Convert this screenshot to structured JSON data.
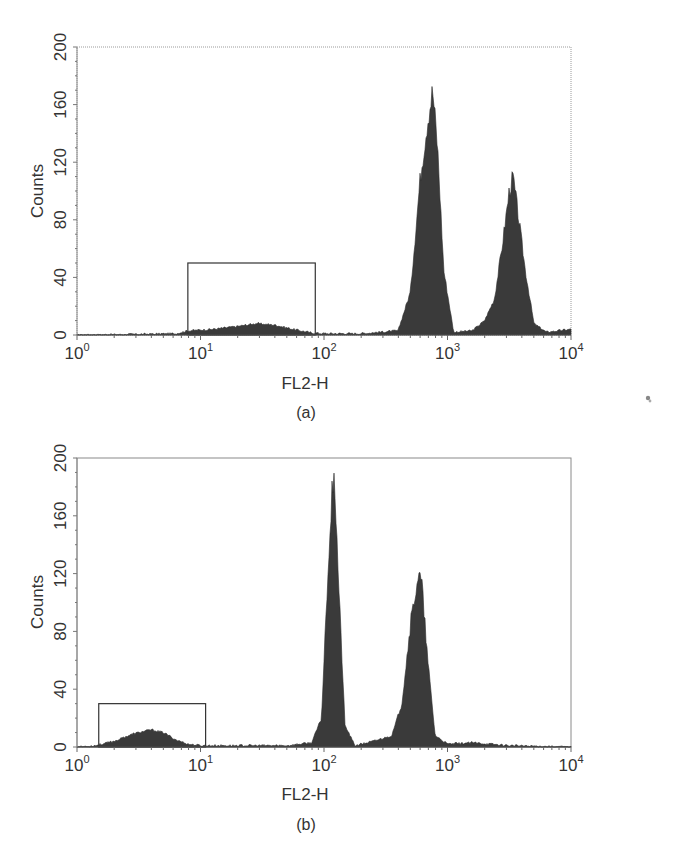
{
  "chart_data": [
    {
      "panel": "(a)",
      "type": "area",
      "title": "",
      "caption": "(a)",
      "xlabel": "FL2-H",
      "ylabel": "Counts",
      "xscale": "log",
      "xlim": [
        1,
        10000
      ],
      "ylim": [
        0,
        200
      ],
      "xticks": [
        "10^0",
        "10^1",
        "10^2",
        "10^3",
        "10^4"
      ],
      "yticks": [
        0,
        40,
        80,
        120,
        160,
        200
      ],
      "grid": false,
      "legend": null,
      "gate": {
        "x_start": 7.9,
        "x_end": 85,
        "height": 50
      },
      "series": [
        {
          "name": "FL2-H histogram",
          "log10_x": [
            0.0,
            0.5,
            0.8,
            0.9,
            1.1,
            1.3,
            1.45,
            1.6,
            1.75,
            1.9,
            2.0,
            2.3,
            2.6,
            2.7,
            2.78,
            2.84,
            2.88,
            2.92,
            2.97,
            3.05,
            3.2,
            3.3,
            3.38,
            3.44,
            3.5,
            3.53,
            3.57,
            3.63,
            3.7,
            3.8,
            4.0
          ],
          "values": [
            0,
            0.5,
            1,
            3,
            4,
            6,
            8,
            7,
            4,
            1.5,
            1,
            1,
            3,
            30,
            110,
            150,
            170,
            130,
            45,
            2,
            3,
            10,
            25,
            60,
            100,
            110,
            85,
            45,
            8,
            2,
            4
          ]
        }
      ],
      "peaks": [
        {
          "x": 760,
          "count": 170
        },
        {
          "x": 3400,
          "count": 110
        }
      ]
    },
    {
      "panel": "(b)",
      "type": "area",
      "title": "",
      "caption": "(b)",
      "xlabel": "FL2-H",
      "ylabel": "Counts",
      "xscale": "log",
      "xlim": [
        1,
        10000
      ],
      "ylim": [
        0,
        200
      ],
      "xticks": [
        "10^0",
        "10^1",
        "10^2",
        "10^3",
        "10^4"
      ],
      "yticks": [
        0,
        40,
        80,
        120,
        160,
        200
      ],
      "grid": false,
      "legend": null,
      "gate": {
        "x_start": 1.5,
        "x_end": 11,
        "height": 30
      },
      "series": [
        {
          "name": "FL2-H histogram",
          "log10_x": [
            0.0,
            0.15,
            0.3,
            0.45,
            0.6,
            0.7,
            0.8,
            0.9,
            1.0,
            1.3,
            1.7,
            1.9,
            1.98,
            2.03,
            2.08,
            2.12,
            2.17,
            2.25,
            2.4,
            2.55,
            2.63,
            2.7,
            2.76,
            2.79,
            2.84,
            2.9,
            3.0,
            3.2,
            3.5,
            4.0
          ],
          "values": [
            0,
            1,
            4,
            9,
            12,
            10,
            5,
            2,
            1,
            1,
            1,
            3,
            20,
            120,
            198,
            110,
            15,
            1,
            4,
            8,
            30,
            85,
            118,
            115,
            60,
            8,
            2,
            3,
            1,
            0
          ]
        }
      ],
      "peaks": [
        {
          "x": 120,
          "count": 198
        },
        {
          "x": 590,
          "count": 120
        }
      ]
    }
  ],
  "panels": {
    "a": {
      "caption": "(a)",
      "xlabel": "FL2-H",
      "ylabel": "Counts",
      "yticks": [
        "0",
        "40",
        "80",
        "120",
        "160",
        "200"
      ],
      "xticks_base": [
        "10",
        "10",
        "10",
        "10",
        "10"
      ],
      "xticks_exp": [
        "0",
        "1",
        "2",
        "3",
        "4"
      ]
    },
    "b": {
      "caption": "(b)",
      "xlabel": "FL2-H",
      "ylabel": "Counts",
      "yticks": [
        "0",
        "40",
        "80",
        "120",
        "160",
        "200"
      ],
      "xticks_base": [
        "10",
        "10",
        "10",
        "10",
        "10"
      ],
      "xticks_exp": [
        "0",
        "1",
        "2",
        "3",
        "4"
      ]
    }
  },
  "colors": {
    "fill": "#3a3a3a",
    "axis": "#8a8a8a",
    "gate": "#333333",
    "text": "#333333"
  }
}
